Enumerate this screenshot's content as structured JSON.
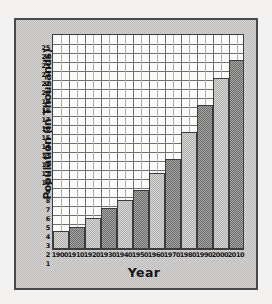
{
  "chart_data": {
    "type": "bar",
    "title": "",
    "xlabel": "Year",
    "ylabel": "Population (in Thousands)",
    "categories": [
      "1900",
      "1910",
      "1920",
      "1930",
      "1940",
      "1950",
      "1960",
      "1970",
      "1980",
      "1990",
      "2000",
      "2010"
    ],
    "values": [
      3,
      3.5,
      4.4,
      5.6,
      6.5,
      7.6,
      9.5,
      11,
      14,
      17,
      20,
      22
    ],
    "ylim": [
      1,
      25
    ],
    "ytick_labels": [
      "25",
      "24",
      "23",
      "22",
      "21",
      "20",
      "19",
      "18",
      "17",
      "16",
      "15",
      "14",
      "13",
      "12",
      "11",
      "10",
      "9",
      "8",
      "7",
      "6",
      "5",
      "4",
      "3",
      "2",
      "1"
    ],
    "grid": true,
    "legend": "none",
    "bar_styles": [
      "light",
      "dark",
      "light",
      "dark",
      "light",
      "dark",
      "light",
      "dark",
      "light",
      "dark",
      "light",
      "dark"
    ],
    "colors": {
      "bar_light": "#b0afad",
      "bar_dark": "#6e6d6b",
      "bar_border": "#3c3c3c",
      "plot_background": "#fbfbfa",
      "gridline": "#6f6f6f",
      "gridline_minor": "#b2b2b2",
      "panel_background": "#b9b8b6",
      "panel_border": "#4a4a4a",
      "page_background": "#f3f2f0",
      "text": "#121212"
    }
  }
}
